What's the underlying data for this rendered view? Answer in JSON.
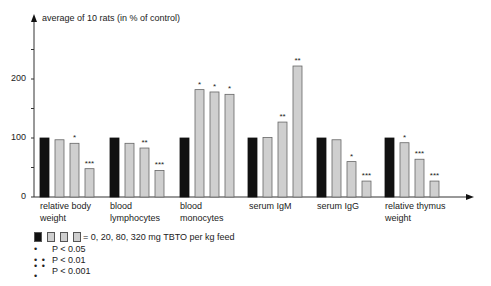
{
  "chart_data": {
    "type": "bar",
    "title": "",
    "ylabel": "average of 10 rats (in % of control)",
    "xlabel": "",
    "ylim": [
      0,
      250
    ],
    "yticks": [
      0,
      50,
      100,
      150,
      200,
      250
    ],
    "ytick_labels": [
      "0",
      "",
      "100",
      "",
      "200",
      ""
    ],
    "grid": false,
    "categories": [
      "relative body\nweight",
      "blood\nlymphocytes",
      "blood\nmonocytes",
      "serum IgM",
      "serum IgG",
      "relative thymus\nweight"
    ],
    "series": [
      {
        "name": "0 mg TBTO per kg feed",
        "color": "#111111",
        "values": [
          100,
          100,
          100,
          100,
          100,
          100
        ],
        "significance": [
          "",
          "",
          "",
          "",
          "",
          ""
        ]
      },
      {
        "name": "20 mg TBTO per kg feed",
        "color": "#cfcfcf",
        "values": [
          97,
          91,
          182,
          101,
          97,
          92
        ],
        "significance": [
          "",
          "",
          "*",
          "",
          "",
          "*"
        ]
      },
      {
        "name": "80 mg TBTO per kg feed",
        "color": "#cfcfcf",
        "values": [
          91,
          83,
          178,
          127,
          60,
          64
        ],
        "significance": [
          "*",
          "**",
          "*",
          "**",
          "*",
          "***"
        ]
      },
      {
        "name": "320 mg TBTO per kg feed",
        "color": "#cfcfcf",
        "values": [
          48,
          45,
          174,
          222,
          27,
          27
        ],
        "significance": [
          "***",
          "***",
          "*",
          "**",
          "***",
          "***"
        ]
      }
    ],
    "legend_position": "bottom-left"
  },
  "legend": {
    "doses_text": "= 0, 20, 80, 320 mg TBTO per kg feed",
    "significance": [
      {
        "dots": "•",
        "label": "P < 0.05"
      },
      {
        "dots": "• •",
        "label": "P < 0.01"
      },
      {
        "dots": "• • •",
        "label": "P < 0.001"
      }
    ]
  },
  "axis": {
    "ylabel": "average of 10 rats (in % of control)",
    "tick_0": "0",
    "tick_100": "100",
    "tick_200": "200"
  },
  "categories": {
    "c0": "relative body\nweight",
    "c1": "blood\nlymphocytes",
    "c2": "blood\nmonocytes",
    "c3": "serum IgM",
    "c4": "serum IgG",
    "c5": "relative thymus\nweight"
  }
}
